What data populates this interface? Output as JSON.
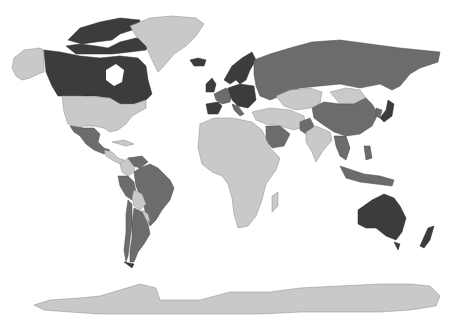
{
  "map": {
    "type": "world-choropleth",
    "projection": "equirectangular-like",
    "background": "#ffffff",
    "colors": {
      "dark": "#3c3c3c",
      "medium": "#6c6c6c",
      "light": "#c9c9c9"
    },
    "regions": [
      {
        "name": "Canada",
        "shade": "dark"
      },
      {
        "name": "Canadian Arctic Archipelago",
        "shade": "dark"
      },
      {
        "name": "Alaska",
        "shade": "light"
      },
      {
        "name": "Greenland",
        "shade": "light"
      },
      {
        "name": "United States",
        "shade": "light"
      },
      {
        "name": "Mexico",
        "shade": "medium"
      },
      {
        "name": "Central America",
        "shade": "light"
      },
      {
        "name": "Colombia",
        "shade": "light"
      },
      {
        "name": "Venezuela",
        "shade": "medium"
      },
      {
        "name": "Brazil",
        "shade": "medium"
      },
      {
        "name": "Peru",
        "shade": "medium"
      },
      {
        "name": "Bolivia",
        "shade": "light"
      },
      {
        "name": "Paraguay",
        "shade": "light"
      },
      {
        "name": "Argentina",
        "shade": "medium"
      },
      {
        "name": "Chile",
        "shade": "medium"
      },
      {
        "name": "Iceland",
        "shade": "dark"
      },
      {
        "name": "Scandinavia",
        "shade": "dark"
      },
      {
        "name": "United Kingdom",
        "shade": "dark"
      },
      {
        "name": "Spain",
        "shade": "dark"
      },
      {
        "name": "Western Europe",
        "shade": "medium"
      },
      {
        "name": "Central Europe",
        "shade": "dark"
      },
      {
        "name": "Russia",
        "shade": "medium"
      },
      {
        "name": "Kazakhstan",
        "shade": "light"
      },
      {
        "name": "Central Asia",
        "shade": "light"
      },
      {
        "name": "Mongolia",
        "shade": "light"
      },
      {
        "name": "China",
        "shade": "medium"
      },
      {
        "name": "Japan",
        "shade": "dark"
      },
      {
        "name": "Middle East",
        "shade": "light"
      },
      {
        "name": "Saudi Arabia",
        "shade": "medium"
      },
      {
        "name": "Pakistan",
        "shade": "medium"
      },
      {
        "name": "India",
        "shade": "light"
      },
      {
        "name": "Southeast Asia",
        "shade": "medium"
      },
      {
        "name": "Indonesia",
        "shade": "medium"
      },
      {
        "name": "Africa",
        "shade": "light"
      },
      {
        "name": "Madagascar",
        "shade": "light"
      },
      {
        "name": "Australia",
        "shade": "dark"
      },
      {
        "name": "New Zealand",
        "shade": "dark"
      },
      {
        "name": "Antarctica",
        "shade": "light"
      }
    ]
  },
  "caption": {
    "text_left": "",
    "text_right": ""
  }
}
